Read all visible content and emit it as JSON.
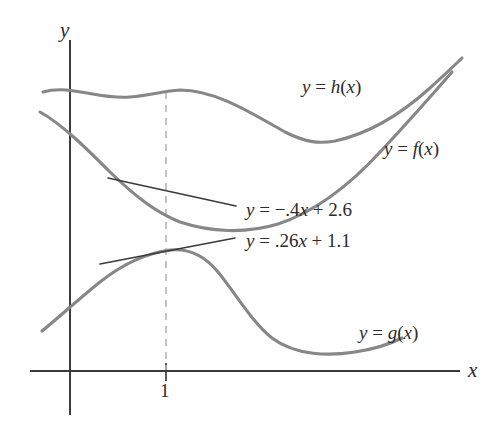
{
  "chart_data": {
    "type": "line",
    "title": "",
    "xlabel": "x",
    "ylabel": "y",
    "grid": false,
    "legend_position": "inline-curve-labels",
    "axes": {
      "x_axis_label": "x",
      "y_axis_label": "y",
      "x_ticks": [
        "1"
      ],
      "y_ticks": []
    },
    "annotations": [
      "y = h(x)",
      "y = f(x)",
      "y = g(x)",
      "y = −.4x + 2.6",
      "y = .26x + 1.1"
    ],
    "series": [
      {
        "name": "h",
        "label": "y = h(x)",
        "color": "#878787",
        "description": "Upper curve: starts high at left, nearly flat with a slight local maximum near x=1, descends to a minimum at mid-right, then rises steeply to the top right."
      },
      {
        "name": "f",
        "label": "y = f(x)",
        "color": "#878787",
        "description": "Middle curve: descends from upper left, reaches a minimum right of center, then rises steeply to the top right, crossing above h near the right edge."
      },
      {
        "name": "g",
        "label": "y = g(x)",
        "color": "#878787",
        "description": "Lower curve: rises steeply from lower left, local maximum just right of x=1, descends to a minimum near the right, then rises slightly."
      },
      {
        "name": "tangent_f_at_1",
        "label": "y = −.4x + 2.6",
        "color": "#3a3a3a",
        "slope": -0.4,
        "intercept": 2.6,
        "tangent_point_x": 1,
        "description": "Tangent line to f at x = 1, negative slope."
      },
      {
        "name": "tangent_g_at_1",
        "label": "y = .26x + 1.1",
        "color": "#3a3a3a",
        "slope": 0.26,
        "intercept": 1.1,
        "tangent_point_x": 1,
        "description": "Tangent line to g at x = 1, positive slope."
      }
    ],
    "reference_line": {
      "type": "vertical-dashed",
      "x_value": 1,
      "color": "#b4b4b4"
    }
  },
  "labels": {
    "y_axis": "y",
    "x_axis": "x",
    "tick_one": "1",
    "h_curve": "y = h(x)",
    "f_curve": "y = f(x)",
    "g_curve": "y = g(x)",
    "tangent_f": "y = −.4x + 2.6",
    "tangent_g": "y = .26x + 1.1"
  },
  "colors": {
    "curve": "#878787",
    "tangent": "#3a3a3a",
    "axis": "#3b3b3b",
    "dashed": "#b4b4b4",
    "background": "#ffffff",
    "text": "#2b2b2b"
  }
}
